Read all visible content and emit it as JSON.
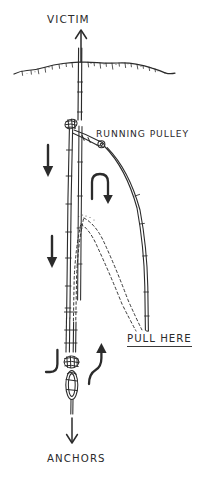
{
  "diagram": {
    "style": "hand-drawn line illustration",
    "background_color": "#ffffff",
    "ink_color": "#2b2b2b",
    "labels": {
      "victim": "VICTIM",
      "running_pulley": "RUNNING PULLEY",
      "pull_here": "PULL HERE",
      "anchors": "ANCHORS"
    },
    "icons": {
      "victim_arrow": "arrow-up-icon",
      "load_arrow_upper": "arrow-down-icon",
      "load_arrow_lower": "arrow-down-icon",
      "pulley_turn_arrow": "u-turn-arrow-down-icon",
      "haul_arrow": "arrow-up-icon",
      "anchor_arrow": "arrow-down-icon",
      "ground_line": "crevasse-lip-icon",
      "pulley": "running-pulley-icon",
      "prusik_upper": "prusik-knot-icon",
      "anchor_carabiner": "carabiner-icon",
      "anchor_prusik": "prusik-knot-icon"
    }
  }
}
